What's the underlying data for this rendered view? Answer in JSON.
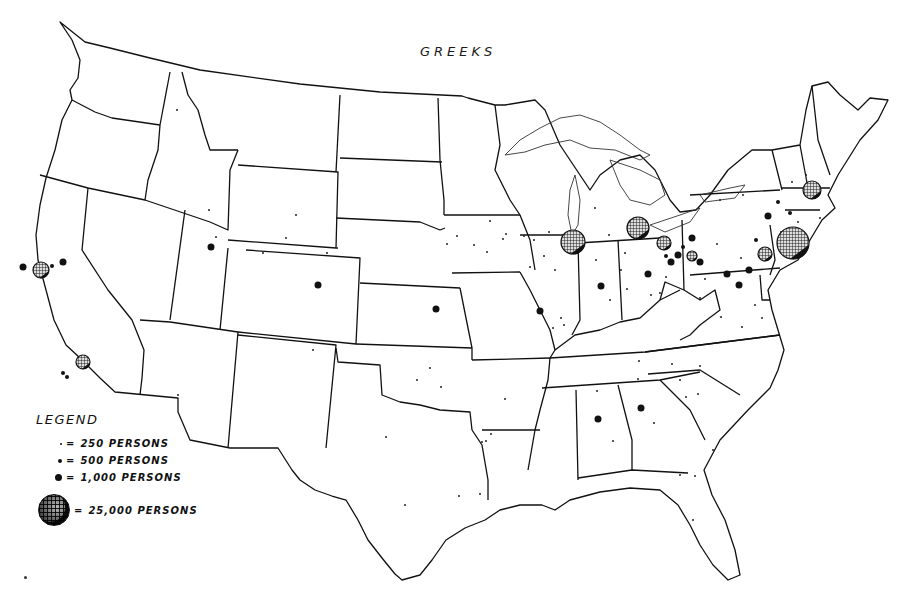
{
  "title": "GREEKS",
  "legend": {
    "title": "LEGEND",
    "items": [
      {
        "symbol": "dot-small",
        "label": "250 PERSONS",
        "size": 2
      },
      {
        "symbol": "dot-medium",
        "label": "500 PERSONS",
        "size": 4
      },
      {
        "symbol": "dot-large",
        "label": "1,000 PERSONS",
        "size": 7
      },
      {
        "symbol": "globe",
        "label": "25,000 PERSONS",
        "size": 30
      }
    ],
    "equals_sign": "="
  },
  "colors": {
    "ink": "#111111",
    "background": "#ffffff"
  },
  "symbols": {
    "globes_25000": [
      {
        "place": "New York City",
        "x": 793,
        "y": 243,
        "r": 16
      },
      {
        "place": "Chicago",
        "x": 573,
        "y": 242,
        "r": 12
      },
      {
        "place": "Detroit",
        "x": 638,
        "y": 228,
        "r": 11
      },
      {
        "place": "San Francisco",
        "x": 41,
        "y": 270,
        "r": 8
      },
      {
        "place": "Los Angeles",
        "x": 83,
        "y": 362,
        "r": 7
      },
      {
        "place": "Cleveland",
        "x": 664,
        "y": 243,
        "r": 7
      },
      {
        "place": "Philadelphia",
        "x": 765,
        "y": 254,
        "r": 7
      },
      {
        "place": "Boston",
        "x": 812,
        "y": 190,
        "r": 9
      },
      {
        "place": "Pittsburgh",
        "x": 692,
        "y": 256,
        "r": 5
      }
    ],
    "dots_1000": [
      {
        "x": 540,
        "y": 311
      },
      {
        "x": 601,
        "y": 286
      },
      {
        "x": 648,
        "y": 274
      },
      {
        "x": 749,
        "y": 270
      },
      {
        "x": 739,
        "y": 285
      },
      {
        "x": 727,
        "y": 274
      },
      {
        "x": 803,
        "y": 236
      },
      {
        "x": 678,
        "y": 255
      },
      {
        "x": 671,
        "y": 262
      },
      {
        "x": 318,
        "y": 285
      },
      {
        "x": 211,
        "y": 247
      },
      {
        "x": 23,
        "y": 267
      },
      {
        "x": 63,
        "y": 262
      },
      {
        "x": 598,
        "y": 419
      },
      {
        "x": 641,
        "y": 408
      },
      {
        "x": 436,
        "y": 309
      },
      {
        "x": 768,
        "y": 216
      },
      {
        "x": 700,
        "y": 262
      },
      {
        "x": 692,
        "y": 238
      }
    ],
    "dots_500": [
      {
        "x": 52,
        "y": 266
      },
      {
        "x": 67,
        "y": 377
      },
      {
        "x": 63,
        "y": 373
      },
      {
        "x": 778,
        "y": 202
      },
      {
        "x": 790,
        "y": 213
      },
      {
        "x": 756,
        "y": 240
      },
      {
        "x": 683,
        "y": 247
      },
      {
        "x": 666,
        "y": 256
      }
    ],
    "dots_250": [
      {
        "x": 177,
        "y": 110
      },
      {
        "x": 209,
        "y": 210
      },
      {
        "x": 216,
        "y": 237
      },
      {
        "x": 296,
        "y": 215
      },
      {
        "x": 286,
        "y": 238
      },
      {
        "x": 263,
        "y": 253
      },
      {
        "x": 327,
        "y": 253
      },
      {
        "x": 337,
        "y": 248
      },
      {
        "x": 178,
        "y": 395
      },
      {
        "x": 313,
        "y": 350
      },
      {
        "x": 430,
        "y": 368
      },
      {
        "x": 417,
        "y": 380
      },
      {
        "x": 441,
        "y": 387
      },
      {
        "x": 505,
        "y": 399
      },
      {
        "x": 486,
        "y": 441
      },
      {
        "x": 386,
        "y": 437
      },
      {
        "x": 405,
        "y": 505
      },
      {
        "x": 459,
        "y": 496
      },
      {
        "x": 480,
        "y": 494
      },
      {
        "x": 491,
        "y": 434
      },
      {
        "x": 482,
        "y": 442
      },
      {
        "x": 490,
        "y": 221
      },
      {
        "x": 506,
        "y": 234
      },
      {
        "x": 474,
        "y": 245
      },
      {
        "x": 487,
        "y": 252
      },
      {
        "x": 457,
        "y": 236
      },
      {
        "x": 447,
        "y": 244
      },
      {
        "x": 524,
        "y": 236
      },
      {
        "x": 534,
        "y": 240
      },
      {
        "x": 530,
        "y": 267
      },
      {
        "x": 544,
        "y": 256
      },
      {
        "x": 555,
        "y": 270
      },
      {
        "x": 561,
        "y": 318
      },
      {
        "x": 553,
        "y": 328
      },
      {
        "x": 503,
        "y": 239
      },
      {
        "x": 564,
        "y": 325
      },
      {
        "x": 610,
        "y": 300
      },
      {
        "x": 596,
        "y": 260
      },
      {
        "x": 627,
        "y": 289
      },
      {
        "x": 660,
        "y": 293
      },
      {
        "x": 639,
        "y": 361
      },
      {
        "x": 597,
        "y": 391
      },
      {
        "x": 613,
        "y": 441
      },
      {
        "x": 654,
        "y": 423
      },
      {
        "x": 698,
        "y": 394
      },
      {
        "x": 686,
        "y": 397
      },
      {
        "x": 672,
        "y": 364
      },
      {
        "x": 700,
        "y": 366
      },
      {
        "x": 638,
        "y": 379
      },
      {
        "x": 680,
        "y": 380
      },
      {
        "x": 713,
        "y": 450
      },
      {
        "x": 695,
        "y": 476
      },
      {
        "x": 680,
        "y": 475
      },
      {
        "x": 693,
        "y": 520
      },
      {
        "x": 743,
        "y": 195
      },
      {
        "x": 720,
        "y": 200
      },
      {
        "x": 792,
        "y": 182
      },
      {
        "x": 806,
        "y": 175
      },
      {
        "x": 820,
        "y": 218
      },
      {
        "x": 798,
        "y": 222
      },
      {
        "x": 781,
        "y": 232
      },
      {
        "x": 717,
        "y": 244
      },
      {
        "x": 741,
        "y": 258
      },
      {
        "x": 705,
        "y": 279
      },
      {
        "x": 700,
        "y": 298
      },
      {
        "x": 721,
        "y": 317
      },
      {
        "x": 742,
        "y": 327
      },
      {
        "x": 755,
        "y": 305
      },
      {
        "x": 762,
        "y": 318
      },
      {
        "x": 609,
        "y": 235
      },
      {
        "x": 625,
        "y": 253
      },
      {
        "x": 666,
        "y": 277
      },
      {
        "x": 651,
        "y": 295
      },
      {
        "x": 621,
        "y": 270
      },
      {
        "x": 549,
        "y": 232
      },
      {
        "x": 595,
        "y": 208
      }
    ]
  }
}
